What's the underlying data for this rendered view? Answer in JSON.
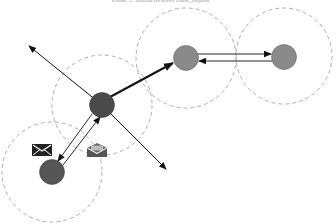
{
  "diagram": {
    "title": "Phase 3: Station receives route_request",
    "nodes": [
      {
        "id": "center",
        "label": "center-node",
        "cx": 102,
        "cy": 105,
        "r": 12,
        "fill": "#4a4a4a"
      },
      {
        "id": "upper",
        "label": "upper-node",
        "cx": 186,
        "cy": 58,
        "r": 12,
        "fill": "#8a8a8a"
      },
      {
        "id": "right",
        "label": "right-node",
        "cx": 284,
        "cy": 57,
        "r": 12,
        "fill": "#8a8a8a"
      },
      {
        "id": "bottom",
        "label": "bottom-left-node",
        "cx": 52,
        "cy": 172,
        "r": 12,
        "fill": "#555555"
      }
    ],
    "ranges": [
      {
        "node": "center",
        "cx": 102,
        "cy": 105,
        "r": 50
      },
      {
        "node": "upper",
        "cx": 186,
        "cy": 58,
        "r": 50
      },
      {
        "node": "right",
        "cx": 284,
        "cy": 56,
        "r": 48
      },
      {
        "node": "bottom",
        "cx": 52,
        "cy": 172,
        "r": 50
      }
    ],
    "edges": [
      {
        "from": "center",
        "to": "upper-left-out",
        "style": "broadcast"
      },
      {
        "from": "center",
        "to": "lower-right-out",
        "style": "broadcast"
      },
      {
        "from": "center",
        "to": "upper",
        "style": "thick"
      },
      {
        "from": "upper",
        "to": "right",
        "style": "request"
      },
      {
        "from": "right",
        "to": "upper",
        "style": "reply"
      },
      {
        "from": "center",
        "to": "bottom",
        "style": "reply"
      },
      {
        "from": "bottom",
        "to": "center",
        "style": "request"
      }
    ],
    "icons": [
      {
        "name": "closed-envelope",
        "x": 32,
        "y": 144
      },
      {
        "name": "open-envelope",
        "x": 87,
        "y": 143
      }
    ],
    "colors": {
      "range_stroke": "#9a9a9a",
      "edge": "#111111",
      "icon_dark": "#222222",
      "icon_gray": "#666666"
    }
  }
}
